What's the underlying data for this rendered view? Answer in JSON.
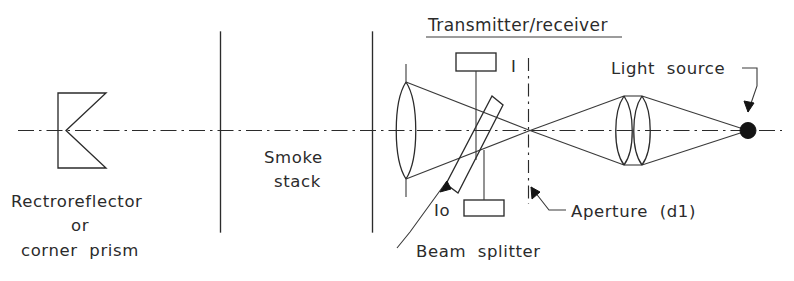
{
  "figure": {
    "type": "optical-schematic",
    "title": "Transmitter/receiver",
    "background_color": "#ffffff",
    "ink_color": "#2b2b2b"
  },
  "labels": {
    "title": "Transmitter/receiver",
    "retroreflector_line1": "Rectroreflector",
    "retroreflector_line2": "or",
    "retroreflector_line3": "corner  prism",
    "smoke_stack_line1": "Smoke",
    "smoke_stack_line2": "stack",
    "detector_i": "I",
    "detector_io": "Io",
    "beam_splitter": "Beam  splitter",
    "aperture": "Aperture  (d1)",
    "light_source": "Light  source"
  },
  "components": [
    {
      "name": "retroreflector",
      "label": "Rectroreflector or corner prism"
    },
    {
      "name": "smoke-stack-wall-left",
      "label": "Smoke stack"
    },
    {
      "name": "smoke-stack-wall-right",
      "label": "Smoke stack"
    },
    {
      "name": "collimating-lens",
      "label": "Collimating lens"
    },
    {
      "name": "beam-splitter",
      "label": "Beam splitter"
    },
    {
      "name": "detector-i",
      "label": "I"
    },
    {
      "name": "detector-io",
      "label": "Io"
    },
    {
      "name": "aperture",
      "label": "Aperture (d1)"
    },
    {
      "name": "condenser-lens-1",
      "label": "Lens"
    },
    {
      "name": "condenser-lens-2",
      "label": "Lens"
    },
    {
      "name": "light-source",
      "label": "Light source"
    },
    {
      "name": "optical-axis",
      "label": "Optical axis"
    }
  ]
}
